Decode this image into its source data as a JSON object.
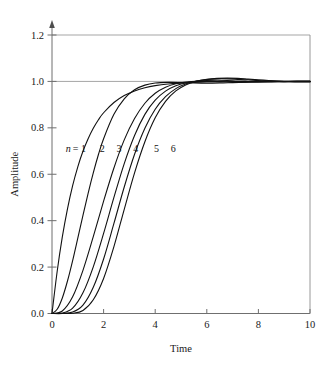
{
  "figure": {
    "background": "#ffffff",
    "ink_color": "#111111",
    "axis_color": "#6f6f6f",
    "grid_color": "#9b9b9b"
  },
  "chart_data": {
    "type": "line",
    "title": "",
    "subtitle": "",
    "xlabel": "Time",
    "ylabel": "Amplitude",
    "xlim": [
      0,
      10
    ],
    "ylim": [
      0,
      1.2
    ],
    "xticks": [
      0,
      2,
      4,
      6,
      8,
      10
    ],
    "xtick_labels": [
      "0",
      "2",
      "4",
      "6",
      "8",
      "10"
    ],
    "yticks": [
      0.0,
      0.2,
      0.4,
      0.6,
      0.8,
      1.0,
      1.2
    ],
    "ytick_labels": [
      "0.0",
      "0.2",
      "0.4",
      "0.6",
      "0.8",
      "1.0",
      "1.2"
    ],
    "grid": "horizontal gridlines at y=1.0 and y=1.2; plot framed on right edge",
    "legend_position": "inline annotations on curves",
    "annotations": [
      {
        "text": "n = 1",
        "x": 1.0,
        "y": 0.695,
        "curve": 1
      },
      {
        "text": "2",
        "x": 1.95,
        "y": 0.695,
        "curve": 2
      },
      {
        "text": "3",
        "x": 2.6,
        "y": 0.695,
        "curve": 3
      },
      {
        "text": "4",
        "x": 3.25,
        "y": 0.695,
        "curve": 4
      },
      {
        "text": "5",
        "x": 4.05,
        "y": 0.695,
        "curve": 5
      },
      {
        "text": "6",
        "x": 4.7,
        "y": 0.695,
        "curve": 6
      }
    ],
    "series": [
      {
        "name": "n = 1",
        "order": 1,
        "x": [
          0,
          0.2,
          0.4,
          0.6,
          0.8,
          1,
          1.2,
          1.4,
          1.6,
          1.8,
          2,
          2.4,
          2.8,
          3.2,
          3.6,
          4,
          4.5,
          5,
          5.5,
          6,
          6.5,
          7,
          7.5,
          8,
          8.5,
          9,
          9.5,
          10
        ],
        "values": [
          0,
          0.181,
          0.33,
          0.451,
          0.551,
          0.632,
          0.699,
          0.753,
          0.798,
          0.835,
          0.865,
          0.909,
          0.939,
          0.959,
          0.973,
          0.982,
          0.989,
          0.993,
          0.996,
          0.998,
          0.998,
          0.999,
          0.999,
          1.0,
          1.0,
          1.0,
          1.0,
          1.0
        ]
      },
      {
        "name": "n = 2",
        "order": 2,
        "x": [
          0,
          0.2,
          0.4,
          0.6,
          0.8,
          1,
          1.2,
          1.4,
          1.6,
          1.8,
          2,
          2.4,
          2.8,
          3.2,
          3.6,
          4,
          4.5,
          5,
          5.5,
          6,
          6.5,
          7,
          7.5,
          8,
          8.5,
          9,
          9.5,
          10
        ],
        "values": [
          0,
          0.018,
          0.067,
          0.14,
          0.228,
          0.325,
          0.423,
          0.518,
          0.606,
          0.685,
          0.753,
          0.858,
          0.925,
          0.964,
          0.984,
          0.993,
          0.996,
          0.995,
          0.993,
          0.992,
          0.993,
          0.995,
          0.997,
          0.999,
          1.0,
          1.0,
          1.0,
          1.0
        ]
      },
      {
        "name": "n = 3",
        "order": 3,
        "x": [
          0,
          0.4,
          0.8,
          1.2,
          1.6,
          2,
          2.4,
          2.8,
          3.2,
          3.6,
          4,
          4.4,
          4.8,
          5.2,
          5.6,
          6,
          6.5,
          7,
          7.5,
          8,
          8.5,
          9,
          9.5,
          10
        ],
        "values": [
          0,
          0.011,
          0.072,
          0.186,
          0.331,
          0.484,
          0.627,
          0.748,
          0.84,
          0.906,
          0.949,
          0.975,
          0.99,
          0.997,
          1.0,
          1.0,
          0.999,
          0.998,
          0.997,
          0.997,
          0.998,
          0.999,
          1.0,
          1.0
        ]
      },
      {
        "name": "n = 4",
        "order": 4,
        "x": [
          0,
          0.4,
          0.8,
          1.2,
          1.6,
          2,
          2.4,
          2.8,
          3.2,
          3.6,
          4,
          4.4,
          4.8,
          5.2,
          5.6,
          6,
          6.4,
          6.8,
          7.2,
          7.6,
          8,
          8.5,
          9,
          9.5,
          10
        ],
        "values": [
          0,
          0.002,
          0.023,
          0.089,
          0.201,
          0.345,
          0.5,
          0.646,
          0.767,
          0.858,
          0.919,
          0.958,
          0.981,
          0.994,
          1.001,
          1.004,
          1.005,
          1.004,
          1.002,
          1.001,
          1.0,
          0.999,
          0.999,
          1.0,
          1.0
        ]
      },
      {
        "name": "n = 5",
        "order": 5,
        "x": [
          0,
          0.4,
          0.8,
          1.2,
          1.6,
          2,
          2.4,
          2.8,
          3.2,
          3.6,
          4,
          4.4,
          4.8,
          5.2,
          5.6,
          6,
          6.4,
          6.8,
          7.2,
          7.6,
          8,
          8.4,
          8.8,
          9.2,
          9.6,
          10
        ],
        "values": [
          0,
          0.0,
          0.006,
          0.036,
          0.113,
          0.235,
          0.388,
          0.545,
          0.686,
          0.798,
          0.88,
          0.934,
          0.969,
          0.99,
          1.002,
          1.008,
          1.011,
          1.011,
          1.009,
          1.007,
          1.004,
          1.002,
          1.0,
          0.999,
          0.999,
          0.999
        ]
      },
      {
        "name": "n = 6",
        "order": 6,
        "x": [
          0,
          0.4,
          0.8,
          1.2,
          1.6,
          2,
          2.4,
          2.8,
          3.2,
          3.6,
          4,
          4.4,
          4.8,
          5.2,
          5.6,
          6,
          6.4,
          6.8,
          7.2,
          7.6,
          8,
          8.4,
          8.8,
          9.2,
          9.6,
          10
        ],
        "values": [
          0,
          0.0,
          0.001,
          0.013,
          0.059,
          0.151,
          0.288,
          0.449,
          0.606,
          0.74,
          0.843,
          0.914,
          0.959,
          0.986,
          1.001,
          1.009,
          1.013,
          1.014,
          1.013,
          1.01,
          1.007,
          1.004,
          1.001,
          0.999,
          0.998,
          0.998
        ]
      }
    ]
  }
}
